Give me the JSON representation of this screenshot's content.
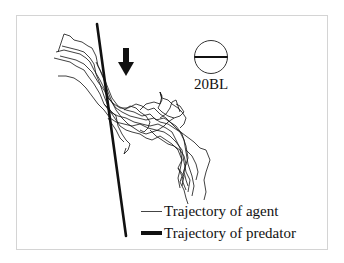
{
  "figure": {
    "scale_bar": {
      "label": "20BL",
      "icon": "circle-with-diameter-icon"
    },
    "direction_arrow": {
      "icon": "arrow-down-icon",
      "meaning": "predator direction"
    },
    "legend": {
      "items": [
        {
          "label": "Trajectory of agent",
          "style": "thin-line"
        },
        {
          "label": "Trajectory of predator",
          "style": "thick-line"
        }
      ]
    },
    "colors": {
      "line": "#111111",
      "background": "#ffffff",
      "frame": "#d4d4d4"
    }
  }
}
